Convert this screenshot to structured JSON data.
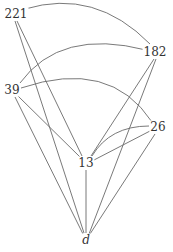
{
  "diagram": {
    "type": "graph",
    "nodes": [
      {
        "id": "n221",
        "label": "221",
        "x": 16,
        "y": 14
      },
      {
        "id": "n182",
        "label": "182",
        "x": 155,
        "y": 52
      },
      {
        "id": "n39",
        "label": "39",
        "x": 12,
        "y": 90
      },
      {
        "id": "n26",
        "label": "26",
        "x": 157,
        "y": 127
      },
      {
        "id": "n13",
        "label": "13",
        "x": 86,
        "y": 163
      },
      {
        "id": "nd",
        "label": "d",
        "x": 86,
        "y": 240
      }
    ],
    "edges": [
      {
        "from": "221",
        "to": "182",
        "style": "curve"
      },
      {
        "from": "39",
        "to": "182",
        "style": "curve"
      },
      {
        "from": "39",
        "to": "26",
        "style": "curve"
      },
      {
        "from": "221",
        "to": "13",
        "style": "line"
      },
      {
        "from": "221",
        "to": "d",
        "style": "line"
      },
      {
        "from": "39",
        "to": "13",
        "style": "line"
      },
      {
        "from": "39",
        "to": "d",
        "style": "line"
      },
      {
        "from": "182",
        "to": "13",
        "style": "line"
      },
      {
        "from": "182",
        "to": "d",
        "style": "line"
      },
      {
        "from": "13",
        "to": "26",
        "style": "curve"
      },
      {
        "from": "13",
        "to": "26",
        "style": "line"
      },
      {
        "from": "26",
        "to": "d",
        "style": "line"
      },
      {
        "from": "13",
        "to": "d",
        "style": "line"
      }
    ],
    "colors": {
      "edge": "#6a6a6a",
      "label": "#333333",
      "background": "#ffffff"
    }
  }
}
